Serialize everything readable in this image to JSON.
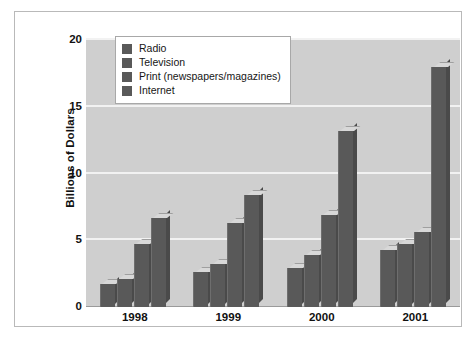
{
  "chart_data": {
    "type": "bar",
    "title": "",
    "xlabel": "",
    "ylabel": "Billions of Dollars",
    "categories": [
      "1998",
      "1999",
      "2000",
      "2001"
    ],
    "ylim": [
      0,
      20
    ],
    "yticks": [
      0,
      5,
      10,
      15,
      20
    ],
    "ytick_labels": [
      "0",
      "5",
      "10",
      "15",
      "20"
    ],
    "grid": true,
    "legend_position": "top-left-inside",
    "series": [
      {
        "name": "Radio",
        "values": [
          1.7,
          2.6,
          2.9,
          4.3
        ],
        "color": "#595959"
      },
      {
        "name": "Television",
        "values": [
          2.1,
          3.2,
          3.9,
          4.7
        ],
        "color": "#595959"
      },
      {
        "name": "Print (newspapers/magazines)",
        "values": [
          4.7,
          6.3,
          6.9,
          5.6
        ],
        "color": "#595959"
      },
      {
        "name": "Internet",
        "values": [
          6.7,
          8.4,
          13.2,
          18.0
        ],
        "color": "#595959"
      }
    ]
  },
  "axes": {
    "y_title": "Billions of Dollars",
    "y_tick_0": "0",
    "y_tick_1": "5",
    "y_tick_2": "10",
    "y_tick_3": "15",
    "y_tick_4": "20",
    "x_tick_0": "1998",
    "x_tick_1": "1999",
    "x_tick_2": "2000",
    "x_tick_3": "2001"
  },
  "legend": {
    "items": [
      {
        "label": "Radio"
      },
      {
        "label": "Television"
      },
      {
        "label": "Print (newspapers/magazines)"
      },
      {
        "label": "Internet"
      }
    ]
  },
  "style": {
    "plot_background": "#cfcfcf",
    "gridline_color": "#f2f2f2",
    "bar_face": "#595959",
    "bar_top": "#d8d8d8",
    "bar_side": "#4a4a4a",
    "frame_border": "#b9b9b9"
  }
}
